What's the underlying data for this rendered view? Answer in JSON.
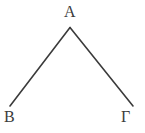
{
  "figure": {
    "type": "geometry-angle-diagram",
    "background_color": "#ffffff",
    "stroke_color": "#3b3b3b",
    "stroke_width": 1.6,
    "label_color": "#3b3b3b"
  },
  "labels": {
    "apex": "Α",
    "bottom_left": "Β",
    "bottom_right": "Γ"
  },
  "geometry": {
    "vertex": {
      "x": 70,
      "y": 27.5
    },
    "left_endpoint": {
      "x": 10,
      "y": 106
    },
    "right_endpoint": {
      "x": 133,
      "y": 106
    },
    "segments": [
      {
        "name": "segment-A-B",
        "x1": 70,
        "y1": 27.5,
        "x2": 10,
        "y2": 106
      },
      {
        "name": "segment-A-Gamma",
        "x1": 70,
        "y1": 27.5,
        "x2": 133,
        "y2": 106
      }
    ]
  },
  "chart_data": {
    "type": "diagram",
    "title": "",
    "points": [
      {
        "label": "Α",
        "x": 70,
        "y": 27.5,
        "role": "vertex"
      },
      {
        "label": "Β",
        "x": 10,
        "y": 106,
        "role": "ray-endpoint"
      },
      {
        "label": "Γ",
        "x": 133,
        "y": 106,
        "role": "ray-endpoint"
      }
    ],
    "edges": [
      {
        "from": "Α",
        "to": "Β"
      },
      {
        "from": "Α",
        "to": "Γ"
      }
    ]
  }
}
